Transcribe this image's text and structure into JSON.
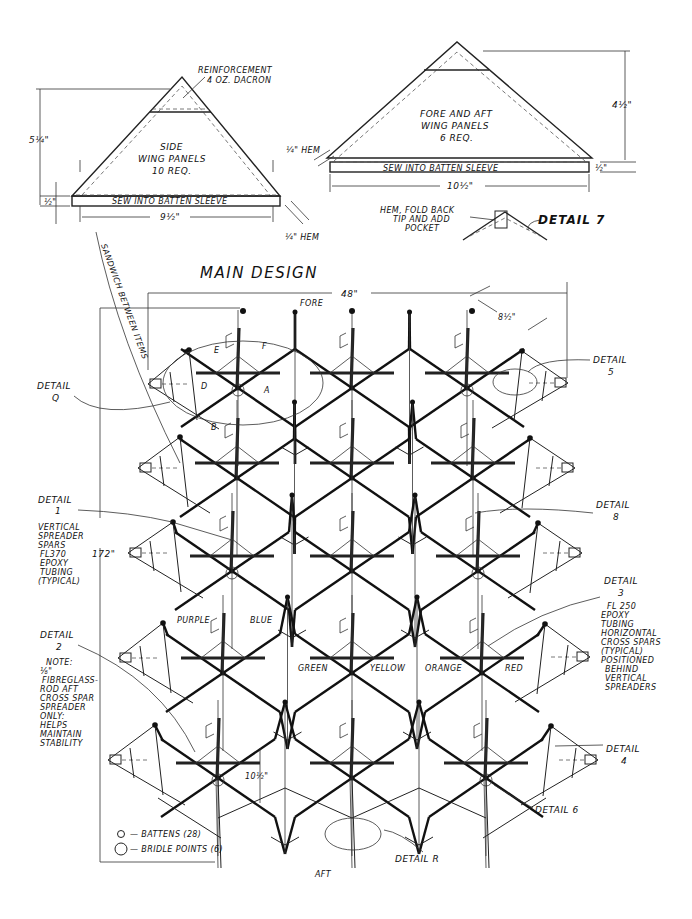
{
  "side_panel": {
    "annotation_title": "REINFORCEMENT",
    "annotation_sub": "4 OZ. DACRON",
    "title_line1": "SIDE",
    "title_line2": "WING PANELS",
    "title_line3": "10 REQ.",
    "sleeve_label": "SEW INTO BATTEN SLEEVE",
    "height_dim": "5¼\"",
    "sleeve_dim": "½\"",
    "width_dim": "9½\"",
    "hem_dim": "¼\" HEM"
  },
  "fore_aft_panel": {
    "title_line1": "FORE AND AFT",
    "title_line2": "WING PANELS",
    "title_line3": "6 REQ.",
    "sleeve_label": "SEW INTO BATTEN SLEEVE",
    "height_dim": "4½\"",
    "sleeve_dim": "½\"",
    "width_dim": "10½\"",
    "hem_dim": "¼\" HEM"
  },
  "detail7": {
    "label": "DETAIL 7",
    "note_line1": "HEM, FOLD BACK",
    "note_line2": "TIP AND ADD",
    "note_line3": "POCKET"
  },
  "main": {
    "title": "MAIN DESIGN",
    "fore_label": "FORE",
    "aft_label": "AFT",
    "width_dim": "48\"",
    "height_dim": "172\"",
    "cell_dim": "8½\"",
    "cell_height_dim": "10½\"",
    "curve_label": "SANDWICH BETWEEN ITEMS",
    "cell_letters": [
      "A",
      "B",
      "D",
      "E",
      "F"
    ],
    "colors": [
      "PURPLE",
      "BLUE",
      "GREEN",
      "YELLOW",
      "ORANGE",
      "RED"
    ]
  },
  "details": {
    "q": {
      "title": "DETAIL",
      "id": "Q"
    },
    "d1": {
      "title": "DETAIL",
      "id": "1",
      "note": [
        "VERTICAL",
        "SPREADER",
        "SPARS",
        "FL370",
        "EPOXY",
        "TUBING",
        "(TYPICAL)"
      ]
    },
    "d2": {
      "title": "DETAIL",
      "id": "2",
      "note": [
        "NOTE:",
        "⅛\"",
        "FIBREGLASS-",
        "ROD AFT",
        "CROSS SPAR",
        "SPREADER",
        "ONLY:",
        "HELPS",
        "MAINTAIN",
        "STABILITY"
      ]
    },
    "d3": {
      "title": "DETAIL",
      "id": "3",
      "note": [
        "FL 250",
        "EPOXY",
        "TUBING",
        "HORIZONTAL",
        "CROSS SPARS",
        "(TYPICAL)",
        "POSITIONED",
        "BEHIND",
        "VERTICAL",
        "SPREADERS"
      ]
    },
    "d4": {
      "title": "DETAIL",
      "id": "4"
    },
    "d5": {
      "title": "DETAIL",
      "id": "5"
    },
    "d6": {
      "label": "DETAIL 6"
    },
    "d8": {
      "title": "DETAIL",
      "id": "8"
    },
    "dR": {
      "label": "DETAIL R"
    }
  },
  "legend": {
    "battens": "— BATTENS (28)",
    "bridle": "— BRIDLE POINTS (6)"
  },
  "lattice": {
    "rows": [
      {
        "y": 388,
        "xs": [
          238,
          352,
          467
        ],
        "side_l": [
          189,
          350
        ],
        "side_r": [
          522,
          351
        ],
        "tip_l": [
          148,
          384
        ],
        "tip_r": [
          568,
          383
        ]
      },
      {
        "y": 478,
        "xs": [
          237,
          352,
          473
        ],
        "side_l": [
          180,
          437
        ],
        "side_r": [
          530,
          438
        ],
        "tip_l": [
          138,
          468
        ],
        "tip_r": [
          575,
          468
        ]
      },
      {
        "y": 571,
        "xs": [
          232,
          352,
          478
        ],
        "side_l": [
          173,
          522
        ],
        "side_r": [
          538,
          523
        ],
        "tip_l": [
          128,
          553
        ],
        "tip_r": [
          582,
          553
        ]
      },
      {
        "y": 673,
        "xs": [
          223,
          352,
          482
        ],
        "side_l": [
          163,
          623
        ],
        "side_r": [
          545,
          624
        ],
        "tip_l": [
          118,
          658
        ],
        "tip_r": [
          590,
          657
        ]
      },
      {
        "y": 778,
        "xs": [
          218,
          352,
          486
        ],
        "side_l": [
          155,
          725
        ],
        "side_r": [
          551,
          726
        ],
        "tip_l": [
          108,
          760
        ],
        "tip_r": [
          598,
          760
        ]
      }
    ]
  },
  "colors": {
    "ink": "#111111",
    "paper": "#ffffff"
  }
}
